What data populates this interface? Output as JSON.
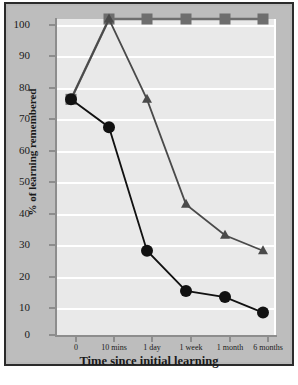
{
  "chart_data": {
    "type": "line",
    "title": "",
    "xlabel": "Time since initial learning",
    "ylabel": "% of learning remembered",
    "categories": [
      "0",
      "10 mins",
      "1 day",
      "1 week",
      "1 month",
      "6 months"
    ],
    "yticks": [
      0,
      10,
      20,
      30,
      40,
      50,
      60,
      70,
      80,
      90,
      100
    ],
    "ylim": [
      0,
      100
    ],
    "grid": "horizontal",
    "legend": "none",
    "series": [
      {
        "name": "square-series",
        "marker": "square",
        "color": "#6e6e6e",
        "values": [
          74,
          100,
          100,
          100,
          100,
          100
        ]
      },
      {
        "name": "triangle-series",
        "marker": "triangle",
        "color": "#4a4a4a",
        "values": [
          74,
          100,
          74,
          40,
          30,
          25
        ]
      },
      {
        "name": "circle-series",
        "marker": "circle",
        "color": "#111111",
        "values": [
          74,
          65,
          25,
          12,
          10,
          5
        ]
      }
    ]
  },
  "axis": {
    "y_tick_labels": [
      "100",
      "90",
      "80",
      "70",
      "60",
      "50",
      "40",
      "30",
      "20",
      "10",
      "0"
    ],
    "x_tick_labels": [
      "0",
      "10 mins",
      "1 day",
      "1 week",
      "1 month",
      "6 months"
    ],
    "y_title": "% of learning remembered",
    "x_title": "Time since initial learning"
  },
  "colors": {
    "figure_background": "#bdbdbd",
    "plot_background": "#e9e9e9",
    "gridline": "#ffffff",
    "frame_border": "#2b2b2b",
    "axis_line": "#8d8d8d",
    "square_marker": "#6e6e6e",
    "triangle_marker": "#4a4a4a",
    "circle_marker": "#111111"
  },
  "caption": {
    "partial_text": ""
  }
}
